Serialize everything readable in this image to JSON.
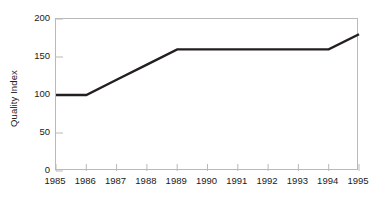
{
  "chart_data": {
    "type": "line",
    "title": "",
    "subtitle": "",
    "xlabel": "",
    "ylabel": "Quality Index",
    "x": [
      1985,
      1986,
      1987,
      1988,
      1989,
      1990,
      1991,
      1992,
      1993,
      1994,
      1995
    ],
    "xtick_labels": [
      "1985",
      "1986",
      "1987",
      "1988",
      "1989",
      "1990",
      "1991",
      "1992",
      "1993",
      "1994",
      "1995"
    ],
    "ytick_labels": [
      "0",
      "50",
      "100",
      "150",
      "200"
    ],
    "ytick_values": [
      0,
      50,
      100,
      150,
      200
    ],
    "xlim": [
      1985,
      1995
    ],
    "ylim": [
      0,
      200
    ],
    "grid": false,
    "legend": null,
    "series": [
      {
        "name": "Quality Index",
        "color": "#231f20",
        "line_width": 2.4,
        "markers": false,
        "values": [
          100,
          100,
          120,
          140,
          160,
          160,
          160,
          160,
          160,
          160,
          180
        ]
      }
    ],
    "annotations": [],
    "frame_color": "#b9b9b9",
    "background_color": "#ffffff",
    "tick_direction": "in"
  }
}
